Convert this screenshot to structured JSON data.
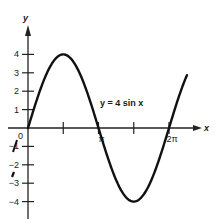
{
  "chart_data": {
    "type": "line",
    "title": "",
    "equation_label": "y = 4 sin x",
    "xlabel": "x",
    "ylabel": "y",
    "x_ticks": [
      {
        "value": 0,
        "label": "0"
      },
      {
        "value": 1.5708,
        "label": ""
      },
      {
        "value": 3.1416,
        "label": "π"
      },
      {
        "value": 4.7124,
        "label": ""
      },
      {
        "value": 6.2832,
        "label": "2π"
      }
    ],
    "y_ticks": [
      {
        "value": 4,
        "label": "4"
      },
      {
        "value": 3,
        "label": "3"
      },
      {
        "value": 2,
        "label": "2"
      },
      {
        "value": 1,
        "label": "1"
      },
      {
        "value": -1,
        "label": "−1"
      },
      {
        "value": -2,
        "label": "−2"
      },
      {
        "value": -3,
        "label": "−3"
      },
      {
        "value": -4,
        "label": "−4"
      }
    ],
    "xlim": [
      0,
      7.1
    ],
    "ylim": [
      -5,
      5.5
    ],
    "grid": false,
    "legend": null,
    "series": [
      {
        "name": "y = 4 sin x",
        "function": "4*sin(x)",
        "x": [
          0,
          0.7854,
          1.5708,
          2.3562,
          3.1416,
          3.927,
          4.7124,
          5.4978,
          6.2832,
          7.0686
        ],
        "values": [
          0,
          2.83,
          4,
          2.83,
          0,
          -2.83,
          -4,
          -2.83,
          0,
          2.83
        ]
      }
    ]
  }
}
